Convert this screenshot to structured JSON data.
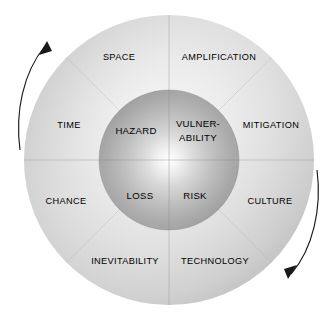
{
  "diagram": {
    "title": "",
    "type": "concentric-circle-diagram",
    "center": {
      "x": 169,
      "y": 160
    },
    "outer_radius": 145,
    "inner_radius": 70,
    "colors": {
      "outer_ring_light": "#f2f2f2",
      "outer_ring_mid": "#d8d8d8",
      "outer_ring_dark": "#a8a8a8",
      "inner_circle_light": "#ffffff",
      "inner_circle_dark": "#9e9e9e",
      "text": "#000000",
      "divider": "#9a9a9a",
      "arrow": "#1a1a1a",
      "background": "#ffffff"
    },
    "inner_circle": {
      "name": "core-quadrants",
      "segments": [
        {
          "id": "hazard",
          "label": "HAZARD",
          "quadrant": "top-left",
          "x": 136,
          "y": 131
        },
        {
          "id": "vulnerability",
          "label": "VULNER-",
          "label_line2": "ABILITY",
          "quadrant": "top-right",
          "x": 198,
          "y": 124
        },
        {
          "id": "loss",
          "label": "LOSS",
          "quadrant": "bottom-left",
          "x": 140,
          "y": 196
        },
        {
          "id": "risk",
          "label": "RISK",
          "quadrant": "bottom-right",
          "x": 195,
          "y": 196
        }
      ]
    },
    "outer_ring": {
      "name": "context-sectors",
      "segments": [
        {
          "id": "space",
          "label": "SPACE",
          "position": "top-left",
          "x": 119,
          "y": 58
        },
        {
          "id": "amplification",
          "label": "AMPLIFICATION",
          "position": "top-right",
          "x": 219,
          "y": 58
        },
        {
          "id": "time",
          "label": "TIME",
          "position": "upper-left",
          "x": 69,
          "y": 126
        },
        {
          "id": "mitigation",
          "label": "MITIGATION",
          "position": "upper-right",
          "x": 271,
          "y": 126
        },
        {
          "id": "chance",
          "label": "CHANCE",
          "position": "lower-left",
          "x": 66,
          "y": 202
        },
        {
          "id": "culture",
          "label": "CULTURE",
          "position": "lower-right",
          "x": 270,
          "y": 202
        },
        {
          "id": "inevitability",
          "label": "INEVITABILITY",
          "position": "bottom-left",
          "x": 125,
          "y": 262
        },
        {
          "id": "technology",
          "label": "TECHNOLOGY",
          "position": "bottom-right",
          "x": 215,
          "y": 262
        }
      ]
    },
    "arrows": [
      {
        "id": "left-arrow",
        "name": "rotation-arrow-left",
        "direction": "upward",
        "side": "left",
        "path": "M 20 148 C 16 110 24 72 47 44",
        "head_points": "47,44 40,54 53,53"
      },
      {
        "id": "right-arrow",
        "name": "rotation-arrow-right",
        "direction": "downward",
        "side": "right",
        "path": "M 316 171 C 320 208 312 248 290 275",
        "head_points": "290,275 297,265 284,266"
      }
    ]
  }
}
